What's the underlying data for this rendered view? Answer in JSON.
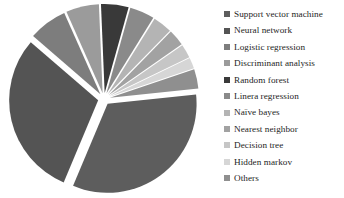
{
  "chart_data": {
    "type": "pie",
    "title": "",
    "exploded": true,
    "start_angle_deg": -6,
    "grid": false,
    "legend_position": "right",
    "categories": [
      "Support vector machine",
      "Neural network",
      "Logistic regression",
      "Discriminant analysis",
      "Random forest",
      "Linera regression",
      "Naïve bayes",
      "Nearest neighbor",
      "Decision tree",
      "Hidden markov",
      "Others"
    ],
    "values": [
      33.0,
      30.0,
      7.0,
      6.0,
      5.0,
      4.5,
      3.5,
      3.0,
      2.5,
      2.0,
      3.5
    ],
    "colors": [
      "#5d5d5d",
      "#545454",
      "#7d7d7d",
      "#9b9b9b",
      "#393939",
      "#8a8a8a",
      "#b4b4b4",
      "#a2a2a2",
      "#c6c6c6",
      "#d6d6d6",
      "#8f8f8f"
    ],
    "xlabel": "",
    "ylabel": ""
  },
  "legend": {
    "items": [
      {
        "label": "Support vector machine",
        "color": "#5d5d5d"
      },
      {
        "label": "Neural network",
        "color": "#545454"
      },
      {
        "label": "Logistic regression",
        "color": "#7d7d7d"
      },
      {
        "label": "Discriminant analysis",
        "color": "#9b9b9b"
      },
      {
        "label": "Random forest",
        "color": "#393939"
      },
      {
        "label": "Linera regression",
        "color": "#8a8a8a"
      },
      {
        "label": "Naïve bayes",
        "color": "#b4b4b4"
      },
      {
        "label": "Nearest neighbor",
        "color": "#a2a2a2"
      },
      {
        "label": "Decision tree",
        "color": "#c6c6c6"
      },
      {
        "label": "Hidden markov",
        "color": "#d6d6d6"
      },
      {
        "label": "Others",
        "color": "#8f8f8f"
      }
    ]
  }
}
